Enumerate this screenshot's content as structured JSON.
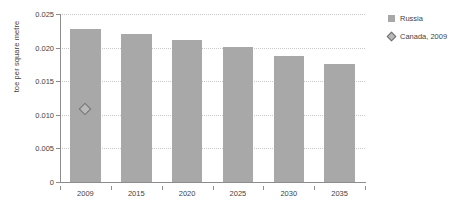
{
  "chart_data": {
    "type": "bar",
    "title": "",
    "xlabel": "",
    "ylabel": "toe per square metre",
    "categories": [
      "2009",
      "2015",
      "2020",
      "2025",
      "2030",
      "2035"
    ],
    "ylim": [
      0,
      0.025
    ],
    "yticks": [
      0,
      0.005,
      0.01,
      0.015,
      0.02,
      0.025
    ],
    "ytick_labels": [
      "0",
      "0.005",
      "0.010",
      "0.015",
      "0.020",
      "0.025"
    ],
    "grid": "horizontal-dotted",
    "legend_position": "right",
    "series": [
      {
        "name": "Russia",
        "type": "bar",
        "color": "#a8a8a8",
        "values": [
          0.0227,
          0.0221,
          0.0212,
          0.0201,
          0.0188,
          0.0176
        ]
      },
      {
        "name": "Canada, 2009",
        "type": "scatter",
        "marker": "diamond",
        "color": "#b9b9b9",
        "edge_color": "#6e6e6e",
        "x": [
          "2009"
        ],
        "values": [
          0.0108
        ]
      }
    ]
  },
  "legend": {
    "items": [
      {
        "label": "Russia",
        "marker": "square-swatch"
      },
      {
        "label": "Canada, 2009",
        "marker": "diamond-swatch"
      }
    ]
  },
  "colors": {
    "bar": "#a8a8a8",
    "marker_fill": "#b9b9b9",
    "marker_edge": "#6e6e6e",
    "gridline": "#c9c9c9",
    "axis": "#8d8d8d",
    "text": "#3f3f3f",
    "background": "#ffffff"
  }
}
